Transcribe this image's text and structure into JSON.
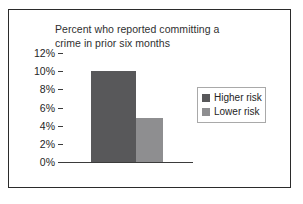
{
  "chart_data": {
    "type": "bar",
    "title": "Percent who reported committing a crime in prior six months",
    "title_lines": [
      "Percent who reported committing a",
      "crime in prior six months"
    ],
    "xlabel": "",
    "ylabel": "",
    "categories": [
      ""
    ],
    "series": [
      {
        "name": "Higher risk",
        "values": [
          10.0
        ],
        "color": "#58585a"
      },
      {
        "name": "Lower risk",
        "values": [
          4.9
        ],
        "color": "#8e8e90"
      }
    ],
    "ylim": [
      0,
      12
    ],
    "ytick_values": [
      12,
      10,
      8,
      6,
      4,
      2,
      0
    ],
    "ytick_labels": [
      "12%",
      "10%",
      "8%",
      "6%",
      "4%",
      "2%",
      "0%"
    ],
    "grid": true,
    "grid_axis": "y",
    "legend": true,
    "legend_position": "right",
    "legend_entries": [
      {
        "label": "Higher risk",
        "color": "#58585a"
      },
      {
        "label": "Lower risk",
        "color": "#8e8e90"
      }
    ]
  },
  "legend": {
    "items": [
      {
        "label": "Higher risk",
        "swatch_name": "legend-swatch-higher-risk"
      },
      {
        "label": "Lower risk",
        "swatch_name": "legend-swatch-lower-risk"
      }
    ]
  },
  "colors": {
    "higher_risk": "#58585a",
    "lower_risk": "#8e8e90",
    "frame": "#2b2b2b",
    "gridline": "#3b3b3b",
    "text": "#252525",
    "background": "#ffffff"
  }
}
